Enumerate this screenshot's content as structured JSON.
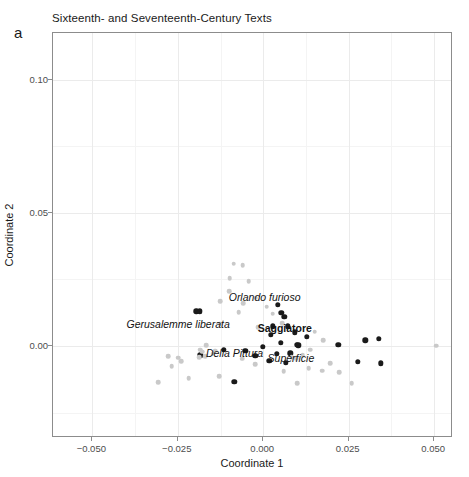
{
  "panel_letter": "a",
  "chart_data": {
    "type": "scatter",
    "title": "Sixteenth- and Seventeenth-Century Texts",
    "xlabel": "Coordinate 1",
    "ylabel": "Coordinate 2",
    "xlim": [
      -0.0615,
      0.0555
    ],
    "ylim": [
      -0.0345,
      0.1175
    ],
    "xticks": [
      -0.05,
      -0.025,
      0.0,
      0.025,
      0.05
    ],
    "xticklabels": [
      "-0.050",
      "-0.025",
      "0.000",
      "0.025",
      "0.050"
    ],
    "yticks": [
      0.0,
      0.05,
      0.1
    ],
    "yticklabels": [
      "0.00",
      "0.05",
      "0.10"
    ],
    "grid": true,
    "legend": "none",
    "series": [
      {
        "name": "highlighted-texts",
        "color": "#1a1a1a",
        "points": [
          {
            "x": -0.0196,
            "y": 0.0131
          },
          {
            "x": -0.0186,
            "y": 0.0131
          },
          {
            "x": 0.0043,
            "y": 0.0155
          },
          {
            "x": 0.0053,
            "y": 0.0126
          },
          {
            "x": 0.0061,
            "y": 0.0111
          },
          {
            "x": 0.0028,
            "y": 0.0074
          },
          {
            "x": 0.0072,
            "y": 0.0074
          },
          {
            "x": 0.0022,
            "y": 0.0043
          },
          {
            "x": 0.0093,
            "y": 0.0051
          },
          {
            "x": 0.0128,
            "y": 0.0034
          },
          {
            "x": 0.0052,
            "y": 0.0012
          },
          {
            "x": 0.0098,
            "y": 0.0005
          },
          {
            "x": 0.0103,
            "y": 0.0003
          },
          {
            "x": 0.0298,
            "y": 0.0021
          },
          {
            "x": 0.0338,
            "y": 0.0028
          },
          {
            "x": 0.0219,
            "y": 0.0005
          },
          {
            "x": -0.0002,
            "y": -0.0003
          },
          {
            "x": -0.0115,
            "y": -0.0013
          },
          {
            "x": -0.0184,
            "y": -0.0035
          },
          {
            "x": -0.0052,
            "y": -0.0018
          },
          {
            "x": -0.0023,
            "y": -0.0036
          },
          {
            "x": 0.0039,
            "y": -0.003
          },
          {
            "x": 0.0079,
            "y": -0.0027
          },
          {
            "x": 0.0018,
            "y": -0.0055
          },
          {
            "x": 0.0066,
            "y": -0.0063
          },
          {
            "x": 0.0276,
            "y": -0.0058
          },
          {
            "x": 0.0343,
            "y": -0.0065
          },
          {
            "x": -0.0085,
            "y": -0.0134
          }
        ]
      },
      {
        "name": "background-texts",
        "color": "#c9c9c9",
        "points": [
          {
            "x": -0.0087,
            "y": 0.0309
          },
          {
            "x": -0.006,
            "y": 0.0303
          },
          {
            "x": -0.0098,
            "y": 0.0255
          },
          {
            "x": -0.0043,
            "y": 0.0243
          },
          {
            "x": -0.0099,
            "y": 0.0205
          },
          {
            "x": -0.0126,
            "y": 0.0169
          },
          {
            "x": -0.0058,
            "y": 0.0162
          },
          {
            "x": -0.0022,
            "y": 0.0182
          },
          {
            "x": 0.001,
            "y": 0.0148
          },
          {
            "x": -0.0072,
            "y": 0.0127
          },
          {
            "x": 0.0028,
            "y": 0.0121
          },
          {
            "x": 0.0055,
            "y": 0.0086
          },
          {
            "x": -0.0126,
            "y": 0.0084
          },
          {
            "x": -0.0016,
            "y": 0.0071
          },
          {
            "x": 0.015,
            "y": 0.0054
          },
          {
            "x": 0.0176,
            "y": 0.0023
          },
          {
            "x": 0.0506,
            "y": 0.0001
          },
          {
            "x": 0.0138,
            "y": -0.0014
          },
          {
            "x": -0.0167,
            "y": 0.0003
          },
          {
            "x": -0.0184,
            "y": -0.0014
          },
          {
            "x": -0.0178,
            "y": -0.0021
          },
          {
            "x": -0.014,
            "y": -0.0018
          },
          {
            "x": -0.0148,
            "y": -0.0028
          },
          {
            "x": -0.0278,
            "y": -0.0037
          },
          {
            "x": -0.0249,
            "y": -0.0044
          },
          {
            "x": -0.024,
            "y": -0.0056
          },
          {
            "x": -0.0268,
            "y": -0.0075
          },
          {
            "x": -0.0187,
            "y": -0.0042
          },
          {
            "x": -0.017,
            "y": -0.0038
          },
          {
            "x": -0.0061,
            "y": -0.0048
          },
          {
            "x": -0.0023,
            "y": -0.0068
          },
          {
            "x": 0.0083,
            "y": -0.0041
          },
          {
            "x": 0.0097,
            "y": -0.0046
          },
          {
            "x": 0.0115,
            "y": -0.0035
          },
          {
            "x": 0.006,
            "y": -0.0095
          },
          {
            "x": 0.0133,
            "y": -0.0082
          },
          {
            "x": 0.0196,
            "y": -0.0065
          },
          {
            "x": 0.0172,
            "y": -0.0093
          },
          {
            "x": 0.0223,
            "y": -0.0098
          },
          {
            "x": -0.0128,
            "y": -0.0112
          },
          {
            "x": -0.0218,
            "y": -0.0121
          },
          {
            "x": 0.0099,
            "y": -0.0139
          },
          {
            "x": -0.0307,
            "y": -0.0136
          },
          {
            "x": 0.0259,
            "y": -0.014
          }
        ]
      }
    ],
    "annotations": [
      {
        "text": "Orlando furioso",
        "x": 0.0004,
        "y": 0.0186,
        "style": "italic"
      },
      {
        "text": "Gerusalemme liberata",
        "x": -0.0249,
        "y": 0.0084,
        "style": "italic"
      },
      {
        "text": "Saggiatore",
        "x": 0.0063,
        "y": 0.0066,
        "style": "bold"
      },
      {
        "text": "Della Pittura",
        "x": -0.0084,
        "y": -0.0025,
        "style": "italic"
      },
      {
        "text": "Superficie",
        "x": 0.0081,
        "y": -0.0043,
        "style": "italic"
      }
    ]
  }
}
